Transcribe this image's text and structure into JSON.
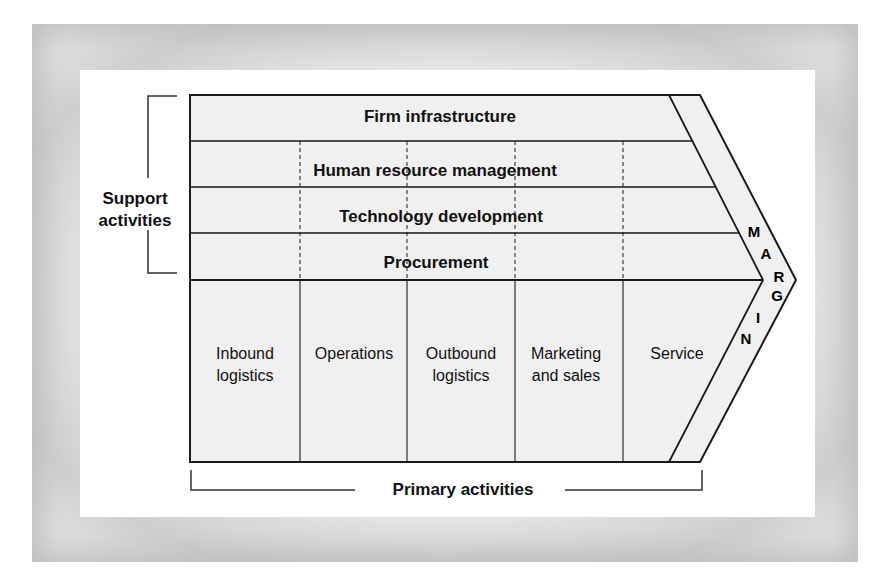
{
  "diagram": {
    "support_label": [
      "Support",
      "activities"
    ],
    "primary_label": "Primary activities",
    "support_activities": [
      {
        "label": "Firm infrastructure"
      },
      {
        "label": "Human resource management"
      },
      {
        "label": "Technology development"
      },
      {
        "label": "Procurement"
      }
    ],
    "primary_activities": [
      {
        "line1": "Inbound",
        "line2": "logistics"
      },
      {
        "line1": "Operations",
        "line2": ""
      },
      {
        "line1": "Outbound",
        "line2": "logistics"
      },
      {
        "line1": "Marketing",
        "line2": "and sales"
      },
      {
        "line1": "Service",
        "line2": ""
      }
    ],
    "margin_letters": [
      "M",
      "A",
      "R",
      "G",
      "I",
      "N"
    ],
    "colors": {
      "fill": "#f0f0f0",
      "line": "#1a1a1a",
      "frame": "#d0d0d0"
    }
  }
}
